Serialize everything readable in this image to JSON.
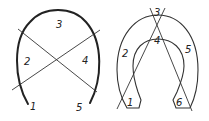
{
  "figures": [
    {
      "name": "arch-left",
      "labels": [
        "1",
        "2",
        "3",
        "4",
        "5"
      ]
    },
    {
      "name": "horseshoe-right",
      "labels": [
        "1",
        "2",
        "3",
        "4",
        "5",
        "6"
      ]
    }
  ],
  "colors": {
    "stroke": "#222222",
    "background": "#ffffff"
  }
}
